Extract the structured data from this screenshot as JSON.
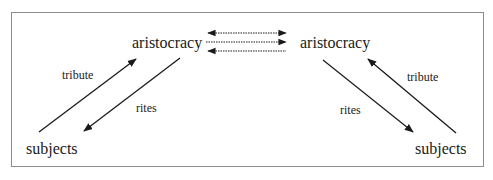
{
  "diagram": {
    "type": "flow-diagram",
    "nodes": {
      "left_aristocracy": "aristocracy",
      "right_aristocracy": "aristocracy",
      "left_subjects": "subjects",
      "right_subjects": "subjects"
    },
    "edges": {
      "left_tribute": "tribute",
      "left_rites": "rites",
      "right_tribute": "tribute",
      "right_rites": "rites"
    },
    "center_links": [
      {
        "style": "dotted",
        "direction": "both"
      },
      {
        "style": "dotted",
        "direction": "right"
      },
      {
        "style": "dotted",
        "direction": "left"
      }
    ],
    "colors": {
      "line": "#1a1a1a",
      "border": "#8c8c8c",
      "background": "#ffffff"
    }
  }
}
